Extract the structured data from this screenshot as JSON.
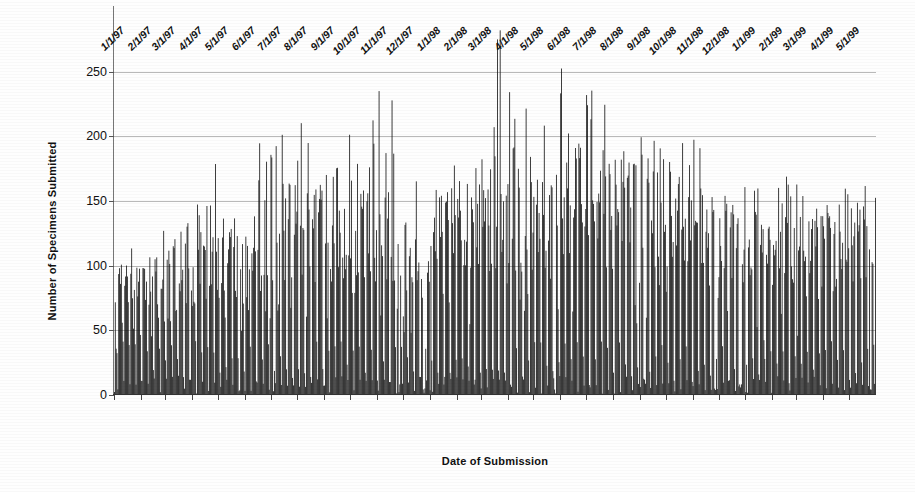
{
  "chart_data": {
    "type": "bar",
    "title": "",
    "xlabel": "Date of Submission",
    "ylabel": "Number of Specimens Submitted",
    "ylim": [
      0,
      290
    ],
    "yticks": [
      0,
      50,
      100,
      150,
      200,
      250
    ],
    "grid": "horizontal",
    "legend": "none",
    "x_tick_labels": [
      "1/1/97",
      "2/1/97",
      "3/1/97",
      "4/1/97",
      "5/1/97",
      "6/1/97",
      "7/1/97",
      "8/1/97",
      "9/1/97",
      "10/1/97",
      "11/1/97",
      "12/1/97",
      "1/1/98",
      "2/1/98",
      "3/1/98",
      "4/1/98",
      "5/1/98",
      "6/1/98",
      "7/1/98",
      "8/1/98",
      "9/1/98",
      "10/1/98",
      "11/1/98",
      "12/1/98",
      "1/1/99",
      "2/1/99",
      "3/1/99",
      "4/1/99",
      "5/1/99"
    ],
    "x_range": [
      "1/1/97",
      "5/31/99"
    ],
    "bar_interval": "daily",
    "n_points": 881,
    "series": [
      {
        "name": "Specimens Submitted",
        "color": "#0d0d0d",
        "monthly_weekday_mean": [
          72,
          80,
          86,
          96,
          104,
          100,
          112,
          118,
          120,
          122,
          118,
          120,
          112,
          124,
          130,
          140,
          142,
          150,
          152,
          148,
          150,
          146,
          132,
          126,
          118,
          112,
          114,
          112,
          116
        ],
        "monthly_weekday_peak": [
          108,
          118,
          128,
          155,
          176,
          148,
          220,
          205,
          204,
          200,
          205,
          243,
          156,
          178,
          185,
          275,
          202,
          246,
          234,
          204,
          208,
          210,
          180,
          160,
          186,
          150,
          181,
          148,
          175
        ],
        "global_max": 275,
        "global_max_date": "3/20/98",
        "weekend_typical": [
          2,
          30
        ]
      }
    ]
  }
}
